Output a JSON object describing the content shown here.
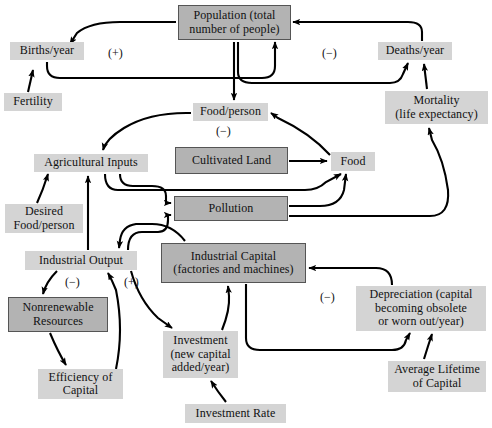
{
  "diagram": {
    "colors": {
      "stock_fill": "#b3b3b3",
      "flow_fill": "#d4d4d4",
      "stroke": "#000000",
      "background": "#ffffff"
    },
    "nodes": [
      {
        "id": "population",
        "label": "Population (total\nnumber of people)",
        "kind": "stock",
        "x": 178,
        "y": 5,
        "w": 113,
        "h": 35,
        "font": 12
      },
      {
        "id": "births",
        "label": "Births/year",
        "kind": "flow",
        "x": 10,
        "y": 42,
        "w": 74,
        "h": 18,
        "font": 12
      },
      {
        "id": "deaths",
        "label": "Deaths/year",
        "kind": "flow",
        "x": 378,
        "y": 42,
        "w": 74,
        "h": 18,
        "font": 12
      },
      {
        "id": "fertility",
        "label": "Fertility",
        "kind": "flow",
        "x": 4,
        "y": 93,
        "w": 58,
        "h": 18,
        "font": 12
      },
      {
        "id": "mortality",
        "label": "Mortality\n(life expectancy)",
        "kind": "flow",
        "x": 385,
        "y": 91,
        "w": 103,
        "h": 33,
        "font": 12
      },
      {
        "id": "food_person",
        "label": "Food/person",
        "kind": "flow",
        "x": 193,
        "y": 103,
        "w": 75,
        "h": 18,
        "font": 12
      },
      {
        "id": "ag_inputs",
        "label": "Agricultural Inputs",
        "kind": "flow",
        "x": 34,
        "y": 154,
        "w": 114,
        "h": 18,
        "font": 12
      },
      {
        "id": "cultivated",
        "label": "Cultivated Land",
        "kind": "stock",
        "x": 175,
        "y": 147,
        "w": 113,
        "h": 27,
        "font": 12
      },
      {
        "id": "food",
        "label": "Food",
        "kind": "flow",
        "x": 331,
        "y": 152,
        "w": 44,
        "h": 19,
        "font": 12
      },
      {
        "id": "desired_food",
        "label": "Desired\nFood/person",
        "kind": "flow",
        "x": 5,
        "y": 204,
        "w": 78,
        "h": 29,
        "font": 12
      },
      {
        "id": "pollution",
        "label": "Pollution",
        "kind": "stock",
        "x": 174,
        "y": 196,
        "w": 114,
        "h": 25,
        "font": 12
      },
      {
        "id": "ind_output",
        "label": "Industrial Output",
        "kind": "flow",
        "x": 25,
        "y": 251,
        "w": 112,
        "h": 19,
        "font": 12
      },
      {
        "id": "ind_capital",
        "label": "Industrial Capital\n(factories and machines)",
        "kind": "stock",
        "x": 161,
        "y": 243,
        "w": 145,
        "h": 40,
        "font": 12
      },
      {
        "id": "nonrenew",
        "label": "Nonrenewable\nResources",
        "kind": "stock",
        "x": 8,
        "y": 297,
        "w": 100,
        "h": 35,
        "font": 12
      },
      {
        "id": "depreciation",
        "label": "Depreciation (capital\nbecoming obsolete\nor worn out/year)",
        "kind": "flow",
        "x": 356,
        "y": 286,
        "w": 130,
        "h": 45,
        "font": 12
      },
      {
        "id": "investment",
        "label": "Investment\n(new capital\nadded/year)",
        "kind": "flow",
        "x": 163,
        "y": 331,
        "w": 75,
        "h": 47,
        "font": 12
      },
      {
        "id": "efficiency",
        "label": "Efficiency of\nCapital",
        "kind": "flow",
        "x": 38,
        "y": 369,
        "w": 85,
        "h": 30,
        "font": 12
      },
      {
        "id": "avg_lifetime",
        "label": "Average Lifetime\nof Capital",
        "kind": "flow",
        "x": 388,
        "y": 361,
        "w": 98,
        "h": 31,
        "font": 12
      },
      {
        "id": "invest_rate",
        "label": "Investment Rate",
        "kind": "flow",
        "x": 185,
        "y": 404,
        "w": 101,
        "h": 19,
        "font": 12
      }
    ],
    "polarity_labels": [
      {
        "id": "pos-population-births",
        "text": "(+)",
        "x": 108,
        "y": 46
      },
      {
        "id": "neg-population-deaths",
        "text": "(−)",
        "x": 322,
        "y": 46
      },
      {
        "id": "neg-foodperson",
        "text": "(−)",
        "x": 216,
        "y": 124
      },
      {
        "id": "neg-industrial-output",
        "text": "(−)",
        "x": 65,
        "y": 275
      },
      {
        "id": "pos-industrial-investment",
        "text": "(+)",
        "x": 124,
        "y": 275
      },
      {
        "id": "neg-depreciation",
        "text": "(−)",
        "x": 320,
        "y": 290
      }
    ]
  }
}
